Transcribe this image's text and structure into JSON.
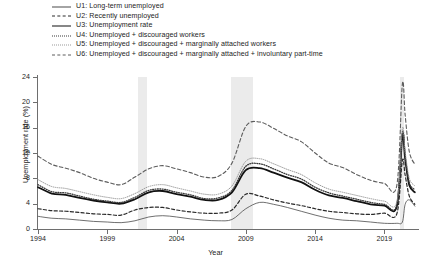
{
  "chart_data": {
    "type": "line",
    "title": "",
    "xlabel": "Year",
    "ylabel": "Unemployment rate (%)",
    "xlim": [
      1994,
      2021.5
    ],
    "ylim": [
      0,
      24
    ],
    "yticks": [
      0,
      4,
      8,
      12,
      16,
      20,
      24
    ],
    "xticks": [
      1994,
      1999,
      2004,
      2009,
      2014,
      2019
    ],
    "grid": false,
    "legend_position": "above-plot",
    "shaded_regions": [
      {
        "label": "recession",
        "x0": 2001.2,
        "x1": 2001.9,
        "color": "#ebebeb"
      },
      {
        "label": "recession",
        "x0": 2007.95,
        "x1": 2009.5,
        "color": "#ebebeb"
      },
      {
        "label": "recession",
        "x0": 2020.1,
        "x1": 2020.4,
        "color": "#ebebeb"
      }
    ],
    "x": [
      1994,
      1995,
      1996,
      1997,
      1998,
      1999,
      2000,
      2001,
      2002,
      2003,
      2004,
      2005,
      2006,
      2007,
      2008,
      2009,
      2010,
      2011,
      2012,
      2013,
      2014,
      2015,
      2016,
      2017,
      2018,
      2019,
      2019.9,
      2020.3,
      2020.5,
      2020.8,
      2021.2
    ],
    "series": [
      {
        "name": "U1: Long-term unemployed",
        "key": "U1",
        "style": "thin-solid",
        "color": "#4a4a4a",
        "values": [
          2.0,
          1.7,
          1.6,
          1.4,
          1.2,
          1.1,
          1.0,
          1.3,
          1.9,
          2.1,
          1.9,
          1.6,
          1.4,
          1.3,
          1.5,
          3.2,
          4.2,
          3.9,
          3.4,
          2.8,
          2.2,
          1.7,
          1.4,
          1.3,
          1.1,
          0.9,
          0.9,
          1.1,
          3.9,
          4.6,
          3.6
        ]
      },
      {
        "name": "U2: Recently unemployed",
        "key": "U2",
        "style": "dashed",
        "color": "#2a2a2a",
        "values": [
          3.2,
          2.9,
          2.8,
          2.6,
          2.4,
          2.3,
          2.2,
          3.0,
          3.4,
          3.4,
          3.0,
          2.7,
          2.5,
          2.5,
          3.0,
          5.5,
          5.2,
          4.6,
          4.1,
          3.7,
          3.2,
          2.8,
          2.6,
          2.4,
          2.3,
          2.5,
          2.4,
          10.8,
          8.5,
          5.2,
          3.9
        ]
      },
      {
        "name": "U3: Unemployment rate",
        "key": "U3",
        "style": "thick-solid",
        "color": "#111111",
        "values": [
          6.6,
          5.6,
          5.4,
          4.9,
          4.5,
          4.2,
          4.0,
          4.7,
          5.8,
          6.0,
          5.5,
          5.1,
          4.6,
          4.6,
          5.8,
          9.3,
          9.6,
          8.9,
          8.1,
          7.4,
          6.2,
          5.3,
          4.9,
          4.4,
          3.9,
          3.7,
          3.6,
          14.8,
          11.1,
          6.9,
          5.8
        ]
      },
      {
        "name": "U4: Unemployed + discouraged workers",
        "key": "U4",
        "style": "dotted",
        "color": "#3a3a3a",
        "values": [
          7.0,
          5.9,
          5.7,
          5.2,
          4.7,
          4.4,
          4.2,
          5.0,
          6.1,
          6.3,
          5.8,
          5.4,
          4.8,
          4.9,
          6.1,
          9.9,
          10.3,
          9.5,
          8.6,
          7.9,
          6.6,
          5.7,
          5.2,
          4.7,
          4.2,
          3.9,
          3.8,
          15.2,
          11.5,
          7.3,
          6.2
        ]
      },
      {
        "name": "U5: Unemployed + discouraged + marginally attached workers",
        "key": "U5",
        "style": "fine-dotted",
        "color": "#9a9a9a",
        "values": [
          7.8,
          6.7,
          6.4,
          5.9,
          5.4,
          5.0,
          4.8,
          5.6,
          6.7,
          7.0,
          6.5,
          6.0,
          5.5,
          5.5,
          6.8,
          10.7,
          11.1,
          10.3,
          9.4,
          8.6,
          7.3,
          6.3,
          5.8,
          5.3,
          4.8,
          4.4,
          4.3,
          15.8,
          12.2,
          8.0,
          6.8
        ]
      },
      {
        "name": "U6: Unemployed + discouraged + marginally attached + involuntary part-time",
        "key": "U6",
        "style": "long-dashed",
        "color": "#5d5d5d",
        "values": [
          11.5,
          10.2,
          9.6,
          8.9,
          8.0,
          7.4,
          7.0,
          8.2,
          9.5,
          10.0,
          9.5,
          8.9,
          8.2,
          8.3,
          10.4,
          16.2,
          16.9,
          15.9,
          14.7,
          13.8,
          12.0,
          10.4,
          9.7,
          8.6,
          7.7,
          7.2,
          6.9,
          22.9,
          18.0,
          12.2,
          10.2
        ]
      }
    ]
  },
  "legend": {
    "items": [
      {
        "label": "U1: Long-term unemployed"
      },
      {
        "label": "U2: Recently unemployed"
      },
      {
        "label": "U3: Unemployment rate"
      },
      {
        "label": "U4: Unemployed + discouraged workers"
      },
      {
        "label": "U5: Unemployed + discouraged + marginally attached workers"
      },
      {
        "label": "U6: Unemployed + discouraged + marginally attached + involuntary part-time"
      }
    ]
  }
}
